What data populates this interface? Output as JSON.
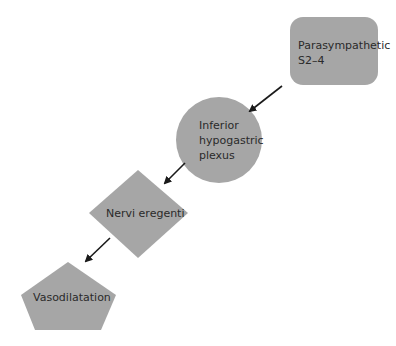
{
  "diagram": {
    "nodes": [
      {
        "id": "parasympathetic",
        "shape": "rounded-rectangle",
        "lines": [
          "Parasympathetic",
          "S2–4"
        ]
      },
      {
        "id": "inferior-hypogastric-plexus",
        "shape": "circle",
        "lines": [
          "Inferior",
          "hypogastric",
          "plexus"
        ]
      },
      {
        "id": "nervi-eregenti",
        "shape": "diamond",
        "lines": [
          "Nervi eregenti"
        ]
      },
      {
        "id": "vasodilatation",
        "shape": "pentagon",
        "lines": [
          "Vasodilatation"
        ]
      }
    ],
    "edges": [
      {
        "from": "parasympathetic",
        "to": "inferior-hypogastric-plexus"
      },
      {
        "from": "inferior-hypogastric-plexus",
        "to": "nervi-eregenti"
      },
      {
        "from": "nervi-eregenti",
        "to": "vasodilatation"
      }
    ],
    "colors": {
      "fill": "#a6a6a6",
      "arrow": "#1a1a1a",
      "text": "#2a2a2a"
    }
  }
}
